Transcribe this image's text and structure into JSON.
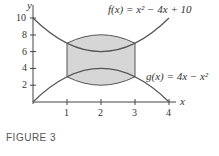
{
  "figure": {
    "caption": "FIGURE 3",
    "x_axis_label": "x",
    "y_axis_label": "y",
    "f_label": "f(x) = x² − 4x + 10",
    "g_label": "g(x) = 4x − x²"
  },
  "chart_data": {
    "type": "line",
    "title": "",
    "xlabel": "x",
    "ylabel": "y",
    "xlim": [
      0,
      4
    ],
    "ylim": [
      0,
      10
    ],
    "x_ticks": [
      1,
      2,
      3,
      4
    ],
    "y_ticks": [
      2,
      4,
      6,
      8,
      10
    ],
    "grid": false,
    "series": [
      {
        "name": "f(x) = x^2 - 4x + 10",
        "x": [
          0,
          1,
          2,
          3,
          4
        ],
        "values": [
          10,
          7,
          6,
          7,
          10
        ]
      },
      {
        "name": "g(x) = 4x - x^2",
        "x": [
          0,
          1,
          2,
          3,
          4
        ],
        "values": [
          0,
          3,
          4,
          3,
          0
        ]
      }
    ],
    "shaded_region": {
      "between": [
        "f",
        "g"
      ],
      "x_from": 1,
      "x_to": 3,
      "color": "#d9d9d9"
    },
    "annotations": [
      "f(x) = x² − 4x + 10",
      "g(x) = 4x − x²"
    ]
  },
  "colors": {
    "curve": "#555555",
    "shade": "#d6d6d6",
    "axis": "#444444"
  }
}
